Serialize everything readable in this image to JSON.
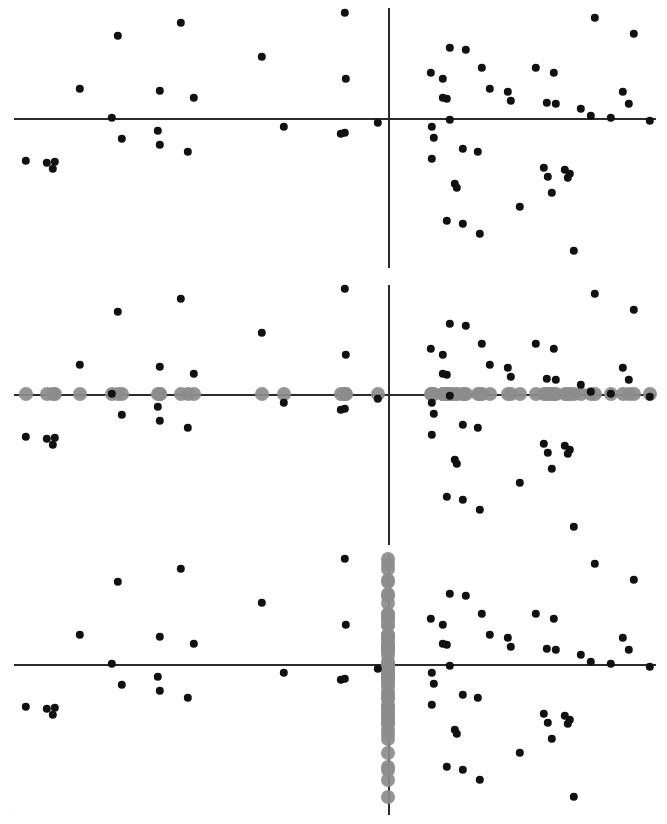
{
  "figure": {
    "title": "",
    "width": 667,
    "height": 824,
    "background": "#ffffff",
    "point_color": "#111111",
    "projection_color": "#8c8c8c",
    "axis_color": "#2b2b2b",
    "point_radius_px": 4.2,
    "projection_radius_px": 7.0,
    "panel_count": 3
  },
  "artifact": {
    "bottom_left_smudge": "..."
  },
  "chart_data": {
    "type": "scatter",
    "title": "",
    "subtitle": "",
    "xlabel": "",
    "ylabel": "",
    "grid": false,
    "legend": null,
    "xlim": [
      -1.0,
      1.0
    ],
    "ylim": [
      -1.0,
      1.0
    ],
    "axes_origin": {
      "x_fraction": 0.5817,
      "note": "vertical axis crosses horizontal axis at this fraction of panel width"
    },
    "panels": [
      {
        "index": 0,
        "name": "raw-scatter",
        "caption": "",
        "show_points": true,
        "projection": "none",
        "axis_origin_px": {
          "x": 388,
          "y": 118
        },
        "axis_h_extent_px": [
          14,
          656
        ],
        "axis_v_extent_px": [
          8,
          268
        ]
      },
      {
        "index": 1,
        "name": "x-axis-projection",
        "caption": "",
        "show_points": true,
        "projection": "horizontal",
        "axis_origin_px": {
          "x": 388,
          "y": 394
        },
        "axis_h_extent_px": [
          14,
          656
        ],
        "axis_v_extent_px": [
          285,
          545
        ]
      },
      {
        "index": 2,
        "name": "y-axis-projection",
        "caption": "",
        "show_points": true,
        "projection": "vertical",
        "axis_origin_px": {
          "x": 388,
          "y": 664
        },
        "axis_h_extent_px": [
          14,
          656
        ],
        "axis_v_extent_px": [
          555,
          815
        ]
      }
    ],
    "x": [
      118,
      181,
      262,
      345,
      80,
      160,
      194,
      112,
      158,
      284,
      122,
      160,
      341,
      188,
      26,
      47,
      55,
      53,
      346,
      378,
      345,
      634,
      595,
      450,
      466,
      482,
      536,
      554,
      431,
      443,
      490,
      508,
      443,
      447,
      556,
      623,
      511,
      547,
      581,
      591,
      611,
      432,
      450,
      434,
      463,
      478,
      432,
      544,
      565,
      570,
      568,
      455,
      548,
      457,
      552,
      520,
      447,
      463,
      480,
      574,
      629,
      650
    ],
    "y": [
      36,
      23,
      57,
      13,
      89,
      91,
      98,
      118,
      131,
      127,
      139,
      145,
      134,
      152,
      161,
      163,
      162,
      169,
      79,
      123,
      133,
      34,
      18,
      48,
      50,
      68,
      68,
      73,
      73,
      79,
      89,
      92,
      98,
      99,
      104,
      92,
      101,
      103,
      109,
      116,
      118,
      127,
      120,
      138,
      149,
      152,
      159,
      168,
      170,
      174,
      178,
      184,
      177,
      188,
      193,
      207,
      221,
      224,
      234,
      251,
      104,
      121
    ],
    "point_count": 62
  }
}
